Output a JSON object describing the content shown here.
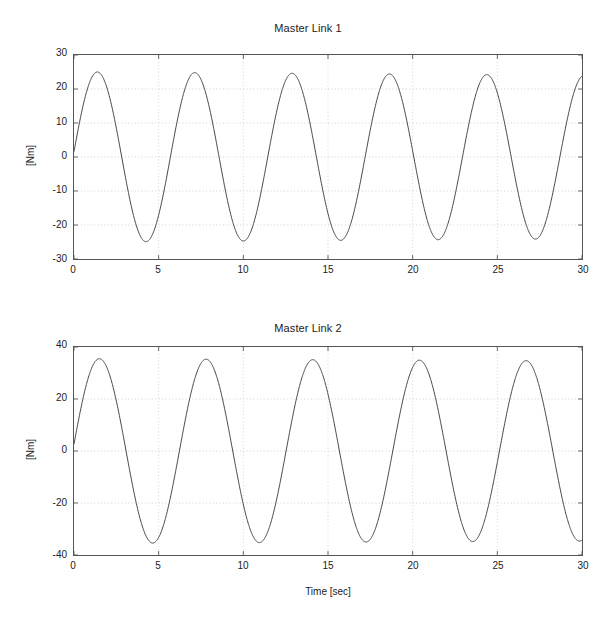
{
  "figures": [
    {
      "id": "master-link-1",
      "title": "Master Link 1",
      "ylabel": "[Nm]",
      "xlabel": "",
      "yticks": [
        "30",
        "20",
        "10",
        "0",
        "-10",
        "-20",
        "-30"
      ],
      "xticks": [
        "0",
        "5",
        "10",
        "15",
        "20",
        "25",
        "30"
      ]
    },
    {
      "id": "master-link-2",
      "title": "Master Link 2",
      "ylabel": "[Nm]",
      "xlabel": "Time [sec]",
      "yticks": [
        "40",
        "20",
        "0",
        "-20",
        "-40"
      ],
      "xticks": [
        "0",
        "5",
        "10",
        "15",
        "20",
        "25",
        "30"
      ]
    }
  ],
  "chart_data": [
    {
      "type": "line",
      "title": "Master Link 1",
      "xlabel": "",
      "ylabel": "[Nm]",
      "xlim": [
        0,
        30
      ],
      "ylim": [
        -30,
        30
      ],
      "xticks": [
        0,
        5,
        10,
        15,
        20,
        25,
        30
      ],
      "yticks": [
        -30,
        -20,
        -10,
        0,
        10,
        20,
        30
      ],
      "grid": true,
      "legend": null,
      "line_color": "#444444",
      "series": [
        {
          "name": "Master Link 1 torque",
          "description": "Sinusoidal torque, amplitude about 25 Nm, period about 5.75 s, starting near -3 Nm and decreasing.",
          "amplitude": 25,
          "period": 5.75,
          "phase_offset_sec": 1.38,
          "mean": 0,
          "start_value": -3,
          "peaks_t": [
            4.3,
            10.0,
            15.9,
            21.5,
            27.2
          ],
          "peaks_y": [
            25,
            24.8,
            24.5,
            24.2,
            24
          ],
          "troughs_t": [
            1.4,
            7.1,
            12.9,
            18.6,
            24.3
          ],
          "troughs_y": [
            -24.7,
            -25.3,
            -25.3,
            -25,
            -24.8
          ],
          "x": [
            0,
            1.4,
            4.3,
            7.1,
            10.0,
            12.9,
            15.9,
            18.6,
            21.5,
            24.3,
            27.2,
            30
          ],
          "y": [
            -3,
            -24.7,
            25,
            -25.3,
            24.8,
            -25.3,
            24.5,
            -25,
            24.2,
            -24.8,
            24,
            -24.6
          ]
        }
      ]
    },
    {
      "type": "line",
      "title": "Master Link 2",
      "xlabel": "Time [sec]",
      "ylabel": "[Nm]",
      "xlim": [
        0,
        30
      ],
      "ylim": [
        -40,
        40
      ],
      "xticks": [
        0,
        5,
        10,
        15,
        20,
        25,
        30
      ],
      "yticks": [
        -40,
        -20,
        0,
        20,
        40
      ],
      "grid": true,
      "legend": null,
      "line_color": "#444444",
      "series": [
        {
          "name": "Master Link 2 torque",
          "description": "Sinusoidal torque, amplitude about 35.5 Nm, period about 6.3 s, starting near -2 Nm and decreasing.",
          "amplitude": 35.5,
          "period": 6.3,
          "phase_offset_sec": 1.5,
          "mean": 0,
          "start_value": -2,
          "peaks_t": [
            4.7,
            11.0,
            17.3,
            23.6,
            29.8
          ],
          "peaks_y": [
            35.3,
            35.1,
            34.8,
            34.6,
            34.4
          ],
          "troughs_t": [
            1.6,
            7.8,
            14.1,
            20.3,
            26.6
          ],
          "troughs_y": [
            -35.4,
            -35.6,
            -35.6,
            -35.4,
            -35.3
          ],
          "x": [
            0,
            1.6,
            4.7,
            7.8,
            11.0,
            14.1,
            17.3,
            20.3,
            23.6,
            26.6,
            29.8
          ],
          "y": [
            -2,
            -35.4,
            35.3,
            -35.6,
            35.1,
            -35.6,
            34.8,
            -35.4,
            34.6,
            -35.3,
            34.4
          ]
        }
      ]
    }
  ]
}
